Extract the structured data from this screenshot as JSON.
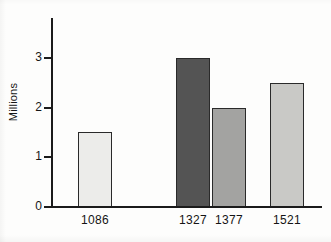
{
  "chart_data": {
    "type": "bar",
    "title": "",
    "xlabel": "",
    "ylabel": "Millions",
    "categories": [
      "1086",
      "1327",
      "1377",
      "1521"
    ],
    "values": [
      1.5,
      3.0,
      2.0,
      2.5
    ],
    "ylim": [
      0,
      3.8
    ],
    "yticks": [
      "0",
      "1",
      "2",
      "3"
    ],
    "ytick_values": [
      0,
      1,
      2,
      3
    ],
    "grid": false,
    "legend": "none",
    "bar_colors": [
      "#ececea",
      "#545454",
      "#a3a3a1",
      "#c9c9c6"
    ],
    "bar_edge_color": "#2a2a2a",
    "axis_color": "#1b1b1b",
    "background_color": "#fdfdfc",
    "series": [
      {
        "name": "Population",
        "points": [
          {
            "category": "1086",
            "value": 1.5,
            "color": "#ececea"
          },
          {
            "category": "1327",
            "value": 3.0,
            "color": "#545454"
          },
          {
            "category": "1377",
            "value": 2.0,
            "color": "#a3a3a1"
          },
          {
            "category": "1521",
            "value": 2.5,
            "color": "#c9c9c6"
          }
        ]
      }
    ]
  }
}
